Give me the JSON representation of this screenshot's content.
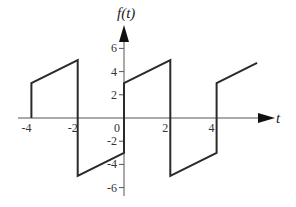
{
  "chart_data": {
    "type": "line",
    "title": "",
    "xlabel": "t",
    "ylabel": "f(t)",
    "xlim": [
      -4.5,
      6
    ],
    "ylim": [
      -6.5,
      7
    ],
    "grid": false,
    "x_ticks": [
      -4,
      -2,
      0,
      2,
      4
    ],
    "x_tick_labels": [
      "-4",
      "-2",
      "0",
      "2",
      "4"
    ],
    "y_ticks": [
      6,
      4,
      2,
      -2,
      -4,
      -6
    ],
    "y_tick_labels": [
      "6",
      "4",
      "2",
      "-2",
      "-4",
      "-6"
    ],
    "series": [
      {
        "name": "f(t)",
        "x": [
          -4,
          -4,
          -2,
          -2,
          0,
          0,
          2,
          2,
          4,
          4,
          5.75
        ],
        "y": [
          0,
          3,
          5,
          -5,
          -3,
          3,
          5,
          -5,
          -3,
          3,
          4.75
        ]
      }
    ],
    "line_color": "#2a2a2a",
    "axis_color": "#555555"
  },
  "labels": {
    "y_axis": "f(t)",
    "x_axis": "t",
    "origin": "0"
  }
}
